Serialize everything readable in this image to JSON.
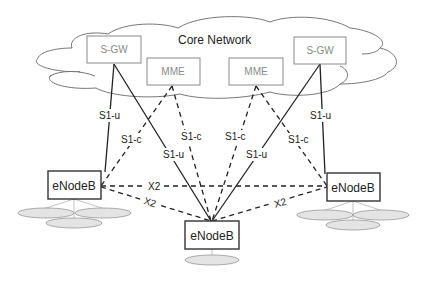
{
  "diagram": {
    "cloud": {
      "title": "Core Network"
    },
    "core_nodes": [
      {
        "id": "sgw-left",
        "label": "S-GW"
      },
      {
        "id": "mme-left",
        "label": "MME"
      },
      {
        "id": "mme-right",
        "label": "MME"
      },
      {
        "id": "sgw-right",
        "label": "S-GW"
      }
    ],
    "enodebs": [
      {
        "id": "enb-left",
        "label": "eNodeB"
      },
      {
        "id": "enb-center",
        "label": "eNodeB"
      },
      {
        "id": "enb-right",
        "label": "eNodeB"
      }
    ],
    "interfaces": {
      "s1u_left_outer": "S1-u",
      "s1c_left_outer": "S1-c",
      "s1c_left_inner": "S1-c",
      "s1u_left_inner": "S1-u",
      "s1c_right_inner": "S1-c",
      "s1u_right_inner": "S1-u",
      "s1c_right_outer": "S1-c",
      "s1u_right_outer": "S1-u",
      "x2_top": "X2",
      "x2_left": "X2",
      "x2_right": "X2"
    },
    "colors": {
      "core_box_stroke": "#8a8a8a",
      "core_text": "#8a8a8a",
      "line": "#222222",
      "cell_fill": "#e4e4e4"
    }
  }
}
